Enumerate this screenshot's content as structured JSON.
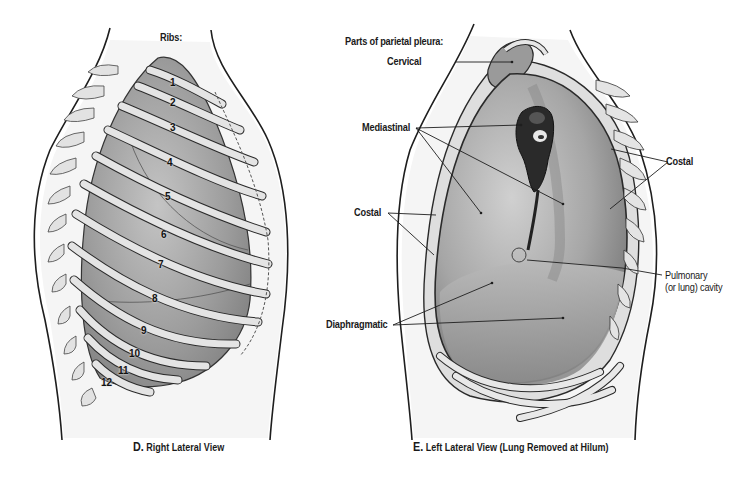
{
  "panel_d": {
    "header": "Ribs:",
    "rib_numbers": [
      {
        "n": "1",
        "x": 171,
        "y": 82
      },
      {
        "n": "2",
        "x": 170,
        "y": 102
      },
      {
        "n": "3",
        "x": 171,
        "y": 127
      },
      {
        "n": "4",
        "x": 168,
        "y": 162
      },
      {
        "n": "5",
        "x": 166,
        "y": 196
      },
      {
        "n": "6",
        "x": 162,
        "y": 234
      },
      {
        "n": "7",
        "x": 159,
        "y": 264
      },
      {
        "n": "8",
        "x": 153,
        "y": 298
      },
      {
        "n": "9",
        "x": 142,
        "y": 330
      },
      {
        "n": "10",
        "x": 131,
        "y": 353
      },
      {
        "n": "11",
        "x": 120,
        "y": 370
      },
      {
        "n": "12",
        "x": 103,
        "y": 382
      }
    ],
    "caption_letter": "D.",
    "caption_text": "Right Lateral View"
  },
  "panel_e": {
    "header": "Parts of parietal pleura:",
    "labels": {
      "cervical": "Cervical",
      "mediastinal": "Mediastinal",
      "costal_left": "Costal",
      "costal_right": "Costal",
      "diaphragmatic": "Diaphragmatic",
      "pulmonary_line1": "Pulmonary",
      "pulmonary_line2": "(or lung) cavity"
    },
    "caption_letter": "E.",
    "caption_text": "Left Lateral View (Lung Removed at Hilum)"
  },
  "colors": {
    "lung_dark": "#8a8a8a",
    "lung_mid": "#a8a8a8",
    "rib_fill": "#dcdcdc",
    "outline": "#1e1e1e",
    "skin": "#f1f1f1"
  }
}
